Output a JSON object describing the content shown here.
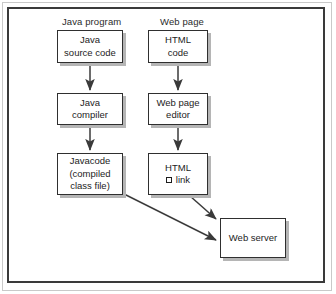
{
  "figure": {
    "columns": [
      {
        "label": "Java program",
        "x": 62,
        "y": 16
      },
      {
        "label": "Web page",
        "x": 160,
        "y": 16
      }
    ],
    "nodes": [
      {
        "id": "java-source-code",
        "lines": [
          "Java",
          "source code"
        ],
        "x": 57,
        "y": 30,
        "w": 66,
        "h": 33
      },
      {
        "id": "html-code",
        "lines": [
          "HTML",
          "code"
        ],
        "x": 148,
        "y": 30,
        "w": 60,
        "h": 33
      },
      {
        "id": "java-compiler",
        "lines": [
          "Java",
          "compiler"
        ],
        "x": 57,
        "y": 93,
        "w": 66,
        "h": 32
      },
      {
        "id": "web-page-editor",
        "lines": [
          "Web page",
          "editor"
        ],
        "x": 148,
        "y": 93,
        "w": 60,
        "h": 32
      },
      {
        "id": "javacode-compiled-class-file",
        "lines": [
          "Javacode",
          "(compiled",
          "class file)"
        ],
        "x": 57,
        "y": 153,
        "w": 66,
        "h": 42
      },
      {
        "id": "html-link",
        "lines": [
          "HTML"
        ],
        "link_label": "link",
        "x": 148,
        "y": 153,
        "w": 60,
        "h": 42
      },
      {
        "id": "web-server",
        "lines": [
          "Web server"
        ],
        "x": 220,
        "y": 218,
        "w": 66,
        "h": 40
      }
    ],
    "arrows": [
      {
        "id": "source-to-compiler",
        "from": "java-source-code",
        "to": "java-compiler",
        "x1": 90,
        "y1": 63,
        "x2": 90,
        "y2": 91
      },
      {
        "id": "htmlcode-to-editor",
        "from": "html-code",
        "to": "web-page-editor",
        "x1": 178,
        "y1": 63,
        "x2": 178,
        "y2": 91
      },
      {
        "id": "compiler-to-javacode",
        "from": "java-compiler",
        "to": "javacode-compiled-class-file",
        "x1": 90,
        "y1": 125,
        "x2": 90,
        "y2": 151
      },
      {
        "id": "editor-to-htmllink",
        "from": "web-page-editor",
        "to": "html-link",
        "x1": 178,
        "y1": 125,
        "x2": 178,
        "y2": 151
      },
      {
        "id": "javacode-to-webserver",
        "from": "javacode-compiled-class-file",
        "to": "web-server",
        "x1": 124,
        "y1": 194,
        "x2": 217,
        "y2": 240
      },
      {
        "id": "htmllink-to-webserver",
        "from": "html-link",
        "to": "web-server",
        "x1": 190,
        "y1": 196,
        "x2": 217,
        "y2": 220
      }
    ],
    "colors": {
      "frame": "#3a3a3a",
      "outer_rule": "#c9c9c9",
      "node_border": "#2f2f2f",
      "node_shadow": "#b5b5b5",
      "arrow": "#3a3a3a",
      "text": "#1d1d1d",
      "background": "#ffffff"
    }
  }
}
